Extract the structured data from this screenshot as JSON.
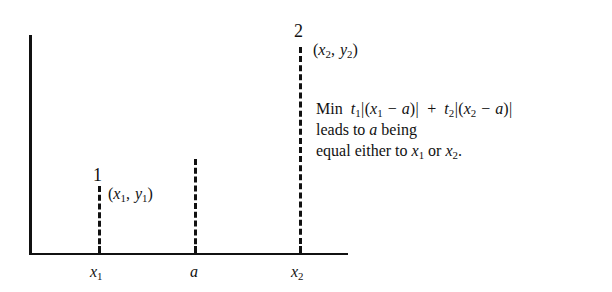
{
  "figure": {
    "background_color": "#ffffff",
    "ink_color": "#111111",
    "axes": {
      "y_axis_name": "vertical-axis",
      "x_axis_name": "horizontal-axis"
    },
    "points": [
      {
        "marker_label": "1",
        "coordinate_label": "(x₁, y₁)",
        "tick_label": "x₁",
        "x_px": 99,
        "height_px": 68
      },
      {
        "marker_label": "2",
        "coordinate_label": "(x₂, y₂)",
        "tick_label": "x₂",
        "x_px": 300,
        "height_px": 206
      }
    ],
    "median_line": {
      "tick_label": "a",
      "x_px": 195,
      "height_px": 94
    },
    "annotation": {
      "line1": {
        "prefix": "Min",
        "term1_weight": "t",
        "term1_weight_sub": "1",
        "term1_expr_open": "|(",
        "term1_var": "x",
        "term1_var_sub": "1",
        "term1_minus": "−",
        "term1_a": "a",
        "term1_close": ")|",
        "plus": "+",
        "term2_weight": "t",
        "term2_weight_sub": "2",
        "term2_expr_open": "|(",
        "term2_var": "x",
        "term2_var_sub": "2",
        "term2_minus": "−",
        "term2_a": "a",
        "term2_close": ")|",
        "plain_text": "Min t₁|(x₁ − a)| + t₂|(x₂ − a)|"
      },
      "line2": {
        "before_var": "leads to",
        "var": "a",
        "after_var": "being",
        "plain_text": "leads to a being"
      },
      "line3": {
        "before_var1": "equal either to",
        "var1": "x",
        "var1_sub": "1",
        "conjunction": "or",
        "var2": "x",
        "var2_sub": "2",
        "period": ".",
        "plain_text": "equal either to x₁ or x₂."
      }
    }
  }
}
